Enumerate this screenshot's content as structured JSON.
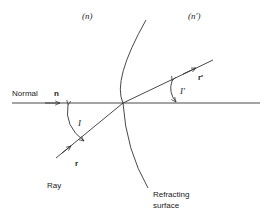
{
  "diagram": {
    "media": {
      "left_index_label": "(n)",
      "right_index_label": "(n′)"
    },
    "normal": {
      "label": "Normal",
      "vector_label": "n"
    },
    "incident_ray": {
      "label": "Ray",
      "vector_label": "r",
      "angle_label": "I"
    },
    "refracted_ray": {
      "vector_label": "r′",
      "angle_label": "I′"
    },
    "surface": {
      "label_line1": "Refracting",
      "label_line2": "surface"
    },
    "colors": {
      "line": "#333333",
      "text": "#222222",
      "background": "#ffffff"
    }
  }
}
